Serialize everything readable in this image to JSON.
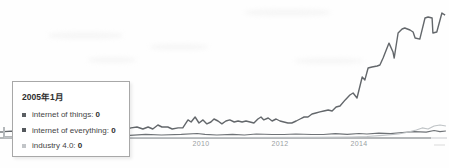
{
  "colors": {
    "axis": "#9b9fa2",
    "axis_fade": "#d0d3d5",
    "tick_label": "#9aa0a3",
    "tooltip_border": "#a8a8a8",
    "tooltip_bg": "#ffffff"
  },
  "tooltip": {
    "title": "2005年1月",
    "items": [
      {
        "label": "internet of things:",
        "value": "0",
        "marker_color": "#5b5f63"
      },
      {
        "label": "internet of everything:",
        "value": "0",
        "marker_color": "#54585c"
      },
      {
        "label": "industry 4.0:",
        "value": "0",
        "marker_color": "#c2c5c8"
      }
    ]
  },
  "chart_data": {
    "type": "line",
    "title": "",
    "xlabel": "",
    "ylabel": "",
    "grid": false,
    "legend_position": "tooltip-overlay",
    "x_axis": {
      "range": [
        2005,
        2016.3
      ],
      "ticks": [
        {
          "label": "2010",
          "year": 2010
        },
        {
          "label": "2012",
          "year": 2012
        },
        {
          "label": "2014",
          "year": 2014
        }
      ]
    },
    "y_axis": {
      "range": [
        0,
        100
      ],
      "visible": false
    },
    "series": [
      {
        "id": "internet-of-things",
        "name": "internet of things",
        "color": "#63676b",
        "width": 1.4,
        "points": [
          [
            2005,
            5
          ],
          [
            2005.3,
            5.4
          ],
          [
            2005.6,
            4.8
          ],
          [
            2006,
            5.2
          ],
          [
            2006.4,
            4.8
          ],
          [
            2006.8,
            5.4
          ],
          [
            2007.2,
            5
          ],
          [
            2007.6,
            5.6
          ],
          [
            2008,
            5.8
          ],
          [
            2008.23,
            7.8
          ],
          [
            2008.38,
            8.5
          ],
          [
            2008.53,
            7
          ],
          [
            2008.66,
            8.5
          ],
          [
            2008.78,
            7
          ],
          [
            2008.91,
            10.1
          ],
          [
            2009.01,
            8.5
          ],
          [
            2009.16,
            8.5
          ],
          [
            2009.27,
            7
          ],
          [
            2009.42,
            7.8
          ],
          [
            2009.54,
            7.8
          ],
          [
            2009.67,
            14
          ],
          [
            2009.75,
            12.4
          ],
          [
            2009.85,
            16.3
          ],
          [
            2009.95,
            11.6
          ],
          [
            2010.05,
            14
          ],
          [
            2010.15,
            10.9
          ],
          [
            2010.25,
            12.4
          ],
          [
            2010.33,
            14.7
          ],
          [
            2010.43,
            13.2
          ],
          [
            2010.53,
            10.9
          ],
          [
            2010.63,
            13.2
          ],
          [
            2010.73,
            14
          ],
          [
            2010.84,
            12.4
          ],
          [
            2010.94,
            13.2
          ],
          [
            2011.04,
            12.4
          ],
          [
            2011.14,
            13.2
          ],
          [
            2011.24,
            12.4
          ],
          [
            2011.34,
            11.6
          ],
          [
            2011.44,
            14.7
          ],
          [
            2011.52,
            16.3
          ],
          [
            2011.59,
            14
          ],
          [
            2011.7,
            15.5
          ],
          [
            2011.8,
            13.2
          ],
          [
            2011.9,
            14.7
          ],
          [
            2012,
            13.2
          ],
          [
            2012.1,
            12.4
          ],
          [
            2012.2,
            11.6
          ],
          [
            2012.3,
            11.6
          ],
          [
            2012.41,
            13.2
          ],
          [
            2012.51,
            14.7
          ],
          [
            2012.61,
            16.3
          ],
          [
            2012.71,
            16.3
          ],
          [
            2012.81,
            18.6
          ],
          [
            2012.91,
            19.4
          ],
          [
            2013.01,
            20.2
          ],
          [
            2013.11,
            20.9
          ],
          [
            2013.22,
            21.7
          ],
          [
            2013.32,
            20.9
          ],
          [
            2013.42,
            24
          ],
          [
            2013.52,
            24.8
          ],
          [
            2013.65,
            29.5
          ],
          [
            2013.77,
            33.3
          ],
          [
            2013.85,
            34.9
          ],
          [
            2013.95,
            31
          ],
          [
            2014.08,
            47.3
          ],
          [
            2014.15,
            45
          ],
          [
            2014.23,
            54.3
          ],
          [
            2014.33,
            55
          ],
          [
            2014.46,
            55.8
          ],
          [
            2014.53,
            56.6
          ],
          [
            2014.61,
            62
          ],
          [
            2014.76,
            73.6
          ],
          [
            2014.86,
            66.7
          ],
          [
            2014.89,
            62
          ],
          [
            2014.99,
            81.4
          ],
          [
            2015.09,
            84.5
          ],
          [
            2015.16,
            85.3
          ],
          [
            2015.29,
            83.7
          ],
          [
            2015.37,
            82.2
          ],
          [
            2015.42,
            77.5
          ],
          [
            2015.54,
            76.7
          ],
          [
            2015.67,
            93
          ],
          [
            2015.75,
            93.8
          ],
          [
            2015.85,
            93
          ],
          [
            2015.87,
            81.4
          ],
          [
            2015.97,
            82.2
          ],
          [
            2016.1,
            96.9
          ],
          [
            2016.18,
            95.3
          ]
        ]
      },
      {
        "id": "internet-of-everything",
        "name": "internet of everything",
        "color": "#6e7276",
        "width": 1.2,
        "points": [
          [
            2005,
            0.8
          ],
          [
            2006,
            0.8
          ],
          [
            2007,
            0.8
          ],
          [
            2007.8,
            1.2
          ],
          [
            2008.2,
            2
          ],
          [
            2008.6,
            2.8
          ],
          [
            2009,
            2.3
          ],
          [
            2009.5,
            2.8
          ],
          [
            2009.9,
            3.5
          ],
          [
            2010.1,
            2.8
          ],
          [
            2010.4,
            2.3
          ],
          [
            2010.8,
            2.8
          ],
          [
            2011.1,
            2.3
          ],
          [
            2011.4,
            3.1
          ],
          [
            2011.8,
            2.7
          ],
          [
            2012.1,
            2.7
          ],
          [
            2012.4,
            3.1
          ],
          [
            2012.8,
            2.7
          ],
          [
            2013.1,
            2.7
          ],
          [
            2013.4,
            3.3
          ],
          [
            2013.7,
            2.9
          ],
          [
            2014,
            3.5
          ],
          [
            2014.2,
            3.1
          ],
          [
            2014.5,
            3.7
          ],
          [
            2014.8,
            3.3
          ],
          [
            2015.1,
            4.3
          ],
          [
            2015.4,
            5
          ],
          [
            2015.7,
            4.5
          ],
          [
            2015.9,
            5.8
          ],
          [
            2016.05,
            5
          ],
          [
            2016.2,
            5.4
          ]
        ]
      },
      {
        "id": "industry-4-0",
        "name": "industry 4.0",
        "color": "#bfc3c6",
        "width": 1.1,
        "points": [
          [
            2005,
            0.3
          ],
          [
            2007,
            0.3
          ],
          [
            2009,
            0.4
          ],
          [
            2011,
            0.4
          ],
          [
            2013,
            0.5
          ],
          [
            2013.8,
            0.8
          ],
          [
            2014.2,
            1.2
          ],
          [
            2014.6,
            2
          ],
          [
            2015,
            3.1
          ],
          [
            2015.2,
            4.3
          ],
          [
            2015.45,
            6.2
          ],
          [
            2015.6,
            7.8
          ],
          [
            2015.75,
            7
          ],
          [
            2015.9,
            9.3
          ],
          [
            2016.05,
            10.1
          ],
          [
            2016.2,
            9.3
          ]
        ]
      }
    ]
  }
}
